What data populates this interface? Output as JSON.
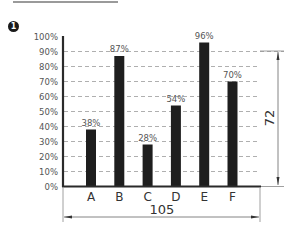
{
  "figure": {
    "badge": "1"
  },
  "chart_data": {
    "type": "bar",
    "title": "",
    "xlabel": "",
    "ylabel": "",
    "categories": [
      "A",
      "B",
      "C",
      "D",
      "E",
      "F"
    ],
    "values": [
      38,
      87,
      28,
      54,
      96,
      70
    ],
    "value_labels": [
      "38%",
      "87%",
      "28%",
      "54%",
      "96%",
      "70%"
    ],
    "ylim": [
      0,
      100
    ],
    "y_ticks": [
      "0%",
      "10%",
      "20%",
      "30%",
      "40%",
      "50%",
      "60%",
      "70%",
      "80%",
      "90%",
      "100%"
    ],
    "grid": "dashed horizontal",
    "bar_color": "#1e1e1e",
    "dimensions": {
      "width_label": "105",
      "height_label": "72"
    }
  }
}
